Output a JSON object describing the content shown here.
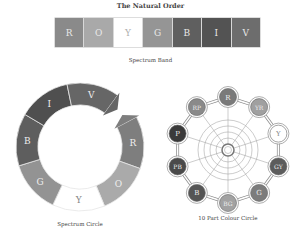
{
  "title": "The Natural Order",
  "spectrum_band": {
    "caption": "Spectrum Band",
    "cells": [
      {
        "label": "R",
        "color": "#8a8a8a",
        "text": "#e8e8e8"
      },
      {
        "label": "O",
        "color": "#a9a9a9",
        "text": "#e8e8e8"
      },
      {
        "label": "Y",
        "color": "#ffffff",
        "text": "#b0b0b0"
      },
      {
        "label": "G",
        "color": "#959595",
        "text": "#e8e8e8"
      },
      {
        "label": "B",
        "color": "#5f5f5f",
        "text": "#e8e8e8"
      },
      {
        "label": "I",
        "color": "#535353",
        "text": "#e8e8e8"
      },
      {
        "label": "V",
        "color": "#6d6d6d",
        "text": "#e8e8e8"
      }
    ]
  },
  "spectrum_circle": {
    "caption": "Spectrum Circle",
    "segments": [
      {
        "label": "R",
        "color": "#7e7e7e"
      },
      {
        "label": "O",
        "color": "#aaaaaa"
      },
      {
        "label": "Y",
        "color": "#ffffff"
      },
      {
        "label": "G",
        "color": "#939393"
      },
      {
        "label": "B",
        "color": "#5e5e5e"
      },
      {
        "label": "I",
        "color": "#4f4f4f"
      },
      {
        "label": "V",
        "color": "#666666"
      }
    ]
  },
  "colour_circle": {
    "caption": "10 Part Colour Circle",
    "nodes": [
      {
        "label": "R",
        "color": "#7a7a7a"
      },
      {
        "label": "YR",
        "color": "#a0a0a0"
      },
      {
        "label": "Y",
        "color": "#ffffff"
      },
      {
        "label": "GY",
        "color": "#5c5c5c"
      },
      {
        "label": "G",
        "color": "#7c7c7c"
      },
      {
        "label": "BG",
        "color": "#a2a2a2"
      },
      {
        "label": "B",
        "color": "#555555"
      },
      {
        "label": "PB",
        "color": "#4a4a4a"
      },
      {
        "label": "P",
        "color": "#3a3a3a"
      },
      {
        "label": "RP",
        "color": "#8a8a8a"
      }
    ]
  }
}
